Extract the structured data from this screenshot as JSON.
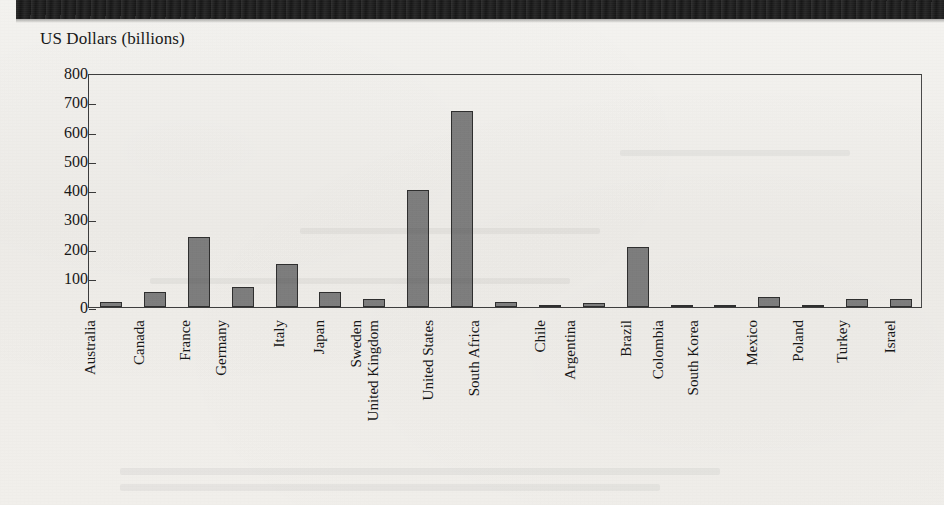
{
  "page": {
    "background_color": "#f1efeb",
    "band_color": "#131313"
  },
  "chart_data": {
    "type": "bar",
    "title": "",
    "ylabel": "US Dollars (billions)",
    "xlabel": "",
    "ylim": [
      0,
      800
    ],
    "ytick_step": 100,
    "yticks": [
      "0",
      "100",
      "200",
      "300",
      "400",
      "500",
      "600",
      "700",
      "800"
    ],
    "grid": false,
    "legend": null,
    "bar_color": "#7b7b7b",
    "bar_edge_color": "#2f2f2f",
    "categories": [
      "Australia",
      "Canada",
      "France",
      "Germany",
      "Italy",
      "Japan",
      "Sweden",
      "United Kingdom",
      "United States",
      "South Africa",
      "Chile",
      "Argentina",
      "Brazil",
      "Colombia",
      "South Korea",
      "Mexico",
      "Poland",
      "Turkey",
      "Israel"
    ],
    "values": [
      17,
      50,
      240,
      70,
      148,
      52,
      27,
      400,
      670,
      18,
      8,
      13,
      206,
      5,
      4,
      35,
      3,
      27,
      28
    ]
  }
}
